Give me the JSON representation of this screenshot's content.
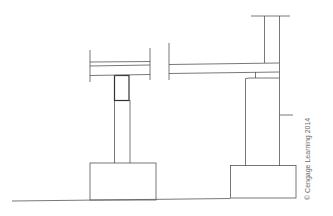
{
  "diagram": {
    "title": "",
    "credit": "© Cengage Learning 2014",
    "colors": {
      "line": "#555555",
      "cap": "#333333",
      "background": "#ffffff"
    },
    "elements": [
      {
        "name": "ground-line"
      },
      {
        "name": "left-footing"
      },
      {
        "name": "left-post"
      },
      {
        "name": "left-post-cap"
      },
      {
        "name": "left-beam"
      },
      {
        "name": "right-beam"
      },
      {
        "name": "upper-wall"
      },
      {
        "name": "right-pier"
      },
      {
        "name": "right-footing"
      }
    ]
  }
}
